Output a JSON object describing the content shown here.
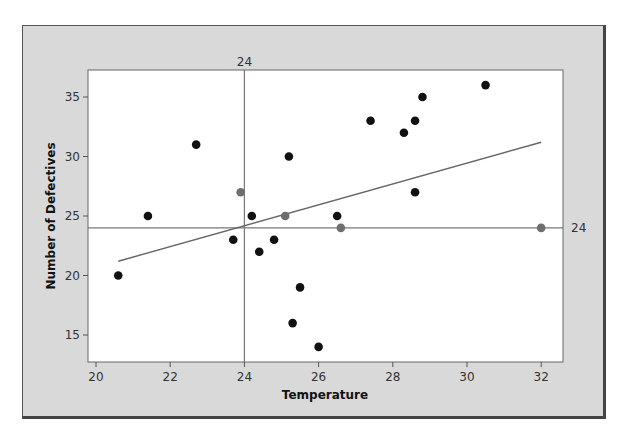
{
  "chart_data": {
    "type": "scatter",
    "title": "",
    "xlabel": "Temperature",
    "ylabel": "Number of Defectives",
    "xlim": [
      19.8,
      32.7
    ],
    "ylim": [
      13,
      37.2
    ],
    "xticks": [
      20,
      22,
      24,
      26,
      28,
      30,
      32
    ],
    "yticks": [
      15,
      20,
      25,
      30,
      35
    ],
    "reference_lines": {
      "x": 24,
      "y": 24,
      "x_label": "24",
      "y_label": "24"
    },
    "regression_line": {
      "x": [
        20.6,
        32.0
      ],
      "y": [
        21.2,
        31.2
      ]
    },
    "colors": {
      "point": "#111111",
      "highlight": "#6e6e6e",
      "line": "#666666",
      "frame": "#d9d9d9"
    },
    "points": [
      {
        "x": 20.6,
        "y": 20,
        "highlight": false
      },
      {
        "x": 21.4,
        "y": 25,
        "highlight": false
      },
      {
        "x": 22.7,
        "y": 31,
        "highlight": false
      },
      {
        "x": 23.7,
        "y": 23,
        "highlight": false
      },
      {
        "x": 23.9,
        "y": 27,
        "highlight": true
      },
      {
        "x": 24.2,
        "y": 25,
        "highlight": false
      },
      {
        "x": 24.4,
        "y": 22,
        "highlight": false
      },
      {
        "x": 24.8,
        "y": 23,
        "highlight": false
      },
      {
        "x": 25.1,
        "y": 25,
        "highlight": true
      },
      {
        "x": 25.2,
        "y": 30,
        "highlight": false
      },
      {
        "x": 25.3,
        "y": 16,
        "highlight": false
      },
      {
        "x": 25.5,
        "y": 19,
        "highlight": false
      },
      {
        "x": 26.0,
        "y": 14,
        "highlight": false
      },
      {
        "x": 26.5,
        "y": 25,
        "highlight": false
      },
      {
        "x": 26.6,
        "y": 24,
        "highlight": true
      },
      {
        "x": 27.4,
        "y": 33,
        "highlight": false
      },
      {
        "x": 28.3,
        "y": 32,
        "highlight": false
      },
      {
        "x": 28.6,
        "y": 33,
        "highlight": false
      },
      {
        "x": 28.6,
        "y": 27,
        "highlight": false
      },
      {
        "x": 28.8,
        "y": 35,
        "highlight": false
      },
      {
        "x": 30.5,
        "y": 36,
        "highlight": false
      },
      {
        "x": 32.0,
        "y": 24,
        "highlight": true
      }
    ]
  }
}
